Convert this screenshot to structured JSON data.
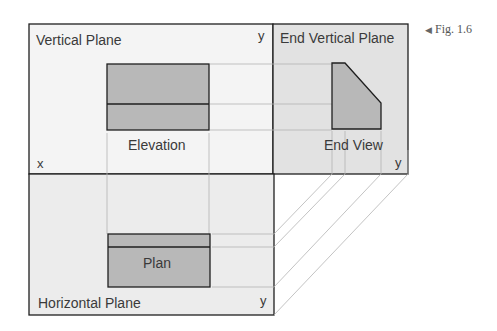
{
  "figure": {
    "label": "Fig. 1.6",
    "pointer_icon": "◀"
  },
  "planes": {
    "vertical": {
      "title": "Vertical Plane",
      "x_axis": "x",
      "y_axis": "y"
    },
    "end_vertical": {
      "title": "End Vertical Plane",
      "y_axis": "y"
    },
    "horizontal": {
      "title": "Horizontal Plane",
      "y_axis": "y"
    }
  },
  "views": {
    "elevation": "Elevation",
    "end_view": "End View",
    "plan": "Plan"
  },
  "colors": {
    "plane_fill": "#f3f3f3",
    "end_plane_fill": "#e2e2e2",
    "horizontal_fill": "#ececec",
    "object_fill": "#b8b8b8",
    "outline": "#1f1f1f",
    "projector": "#b0b0b0"
  }
}
